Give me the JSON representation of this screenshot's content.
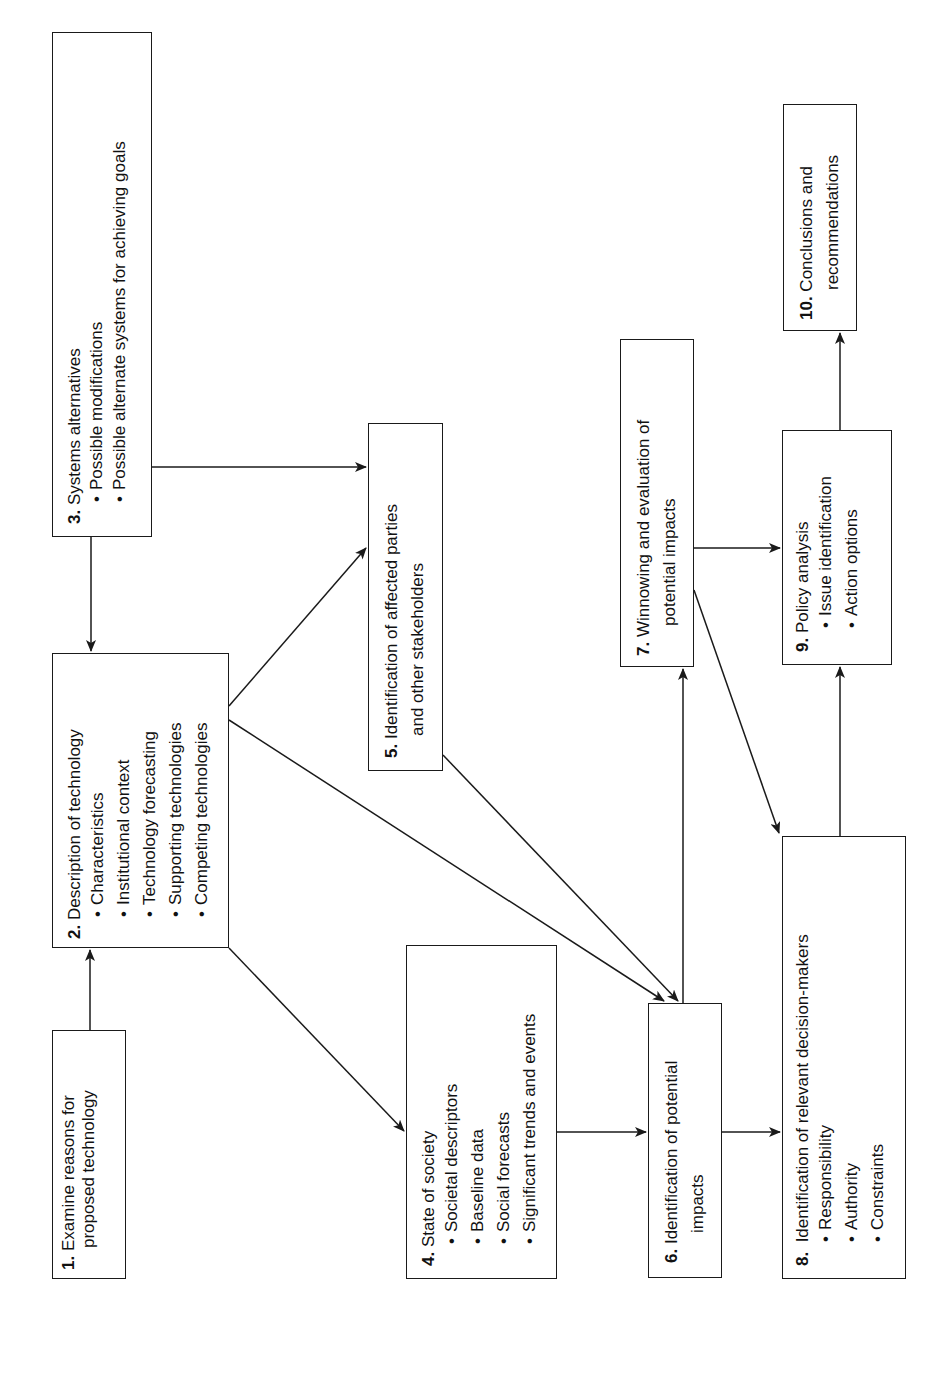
{
  "diagram": {
    "orientation": "rotated-90-ccw",
    "colors": {
      "line": "#1a1a1a",
      "background": "#ffffff"
    },
    "boxes": {
      "b1": {
        "num": "1.",
        "title": "Examine reasons for",
        "title2": "proposed technology",
        "bullets": []
      },
      "b2": {
        "num": "2.",
        "title": "Description of technology",
        "bullets": [
          "Characteristics",
          "Institutional context",
          "Technology forecasting",
          "Supporting technologies",
          "Competing technologies"
        ]
      },
      "b3": {
        "num": "3.",
        "title": "Systems alternatives",
        "bullets": [
          "Possible modifications",
          "Possible alternate systems for achieving goals"
        ]
      },
      "b4": {
        "num": "4.",
        "title": "State of society",
        "bullets": [
          "Societal descriptors",
          "Baseline data",
          "Social forecasts",
          "Significant trends and events"
        ]
      },
      "b5": {
        "num": "5.",
        "title": "Identification of affected parties",
        "title2": "and other stakeholders",
        "bullets": []
      },
      "b6": {
        "num": "6.",
        "title": "Identification of potential",
        "title2": "impacts",
        "bullets": []
      },
      "b7": {
        "num": "7.",
        "title": "Winnowing and evaluation of",
        "title2": "potential impacts",
        "bullets": []
      },
      "b8": {
        "num": "8.",
        "title": "Identification of relevant decision-makers",
        "bullets": [
          "Responsibility",
          "Authority",
          "Constraints"
        ]
      },
      "b9": {
        "num": "9.",
        "title": "Policy analysis",
        "bullets": [
          "Issue identification",
          "Action options"
        ]
      },
      "b10": {
        "num": "10.",
        "title": "Conclusions and",
        "title2": "recommendations",
        "bullets": []
      }
    },
    "edges": [
      {
        "from": "1",
        "to": "2"
      },
      {
        "from": "3",
        "to": "2"
      },
      {
        "from": "3",
        "to": "5"
      },
      {
        "from": "2",
        "to": "5"
      },
      {
        "from": "2",
        "to": "6"
      },
      {
        "from": "2",
        "to": "4"
      },
      {
        "from": "5",
        "to": "6"
      },
      {
        "from": "4",
        "to": "6"
      },
      {
        "from": "6",
        "to": "7"
      },
      {
        "from": "6",
        "to": "8"
      },
      {
        "from": "7",
        "to": "9"
      },
      {
        "from": "7",
        "to": "8"
      },
      {
        "from": "8",
        "to": "9"
      },
      {
        "from": "9",
        "to": "10"
      }
    ]
  }
}
